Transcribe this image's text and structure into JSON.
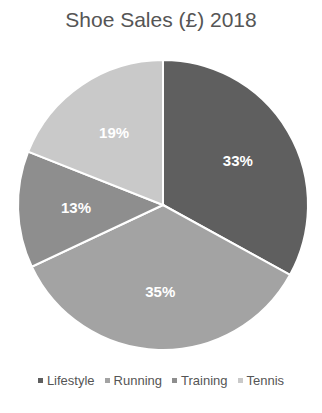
{
  "chart_data": {
    "type": "pie",
    "title": "Shoe Sales (£) 2018",
    "categories": [
      "Lifestyle",
      "Running",
      "Training",
      "Tennis"
    ],
    "values": [
      33,
      35,
      13,
      19
    ],
    "labels": [
      "33%",
      "35%",
      "13%",
      "19%"
    ],
    "colors": [
      "#5f5f5f",
      "#a3a3a3",
      "#8e8e8e",
      "#c9c9c9"
    ],
    "legend_position": "bottom"
  }
}
